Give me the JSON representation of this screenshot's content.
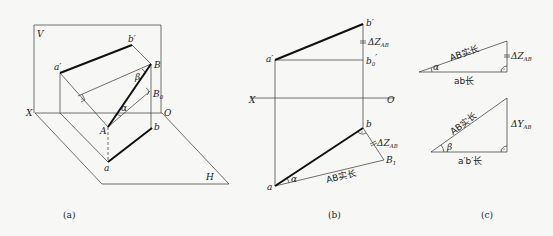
{
  "figure": {
    "panel_a": {
      "caption": "(a)",
      "labels": {
        "V": "V",
        "H": "H",
        "X": "X",
        "O": "O",
        "a_prime": "a′",
        "b_prime": "b′",
        "A": "A",
        "B": "B",
        "a": "a",
        "b": "b",
        "B0": "B",
        "B0_sub": "0",
        "alpha": "α",
        "beta": "β"
      }
    },
    "panel_b": {
      "caption": "(b)",
      "labels": {
        "a_prime": "a′",
        "b_prime": "b′",
        "b0_prime": "b",
        "b0_sub": "0",
        "b0_prime_mark": "′",
        "X": "X",
        "O": "O",
        "a": "a",
        "b": "b",
        "B1": "B",
        "B1_sub": "1",
        "alpha": "α",
        "dz_top": "ΔZ",
        "dz_top_sub": "AB",
        "dz_bottom": "ΔZ",
        "dz_bottom_sub": "AB",
        "true_length": "AB实长"
      }
    },
    "panel_c": {
      "caption": "(c)",
      "triangle_1": {
        "hypotenuse": "AB实长",
        "base": "ab长",
        "side": "ΔZ",
        "side_sub": "AB",
        "angle": "α"
      },
      "triangle_2": {
        "hypotenuse": "AB实长",
        "base": "a′b′长",
        "side": "ΔY",
        "side_sub": "AB",
        "angle": "β"
      }
    }
  }
}
